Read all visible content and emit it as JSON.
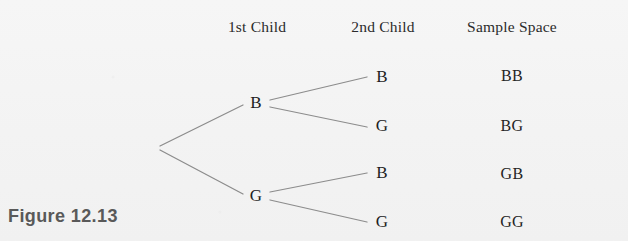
{
  "figure": {
    "caption": "Figure 12.13",
    "background_color": "#f4f4f4",
    "line_color": "#8c8c8c",
    "text_color": "#1f1f1f",
    "caption_color": "#595959"
  },
  "headers": [
    {
      "label": "1st Child",
      "x": 257,
      "y": 31
    },
    {
      "label": "2nd Child",
      "x": 383,
      "y": 31
    },
    {
      "label": "Sample Space",
      "x": 512,
      "y": 31
    }
  ],
  "tree": {
    "root": {
      "x": 158,
      "y": 148
    },
    "level1": [
      {
        "label": "B",
        "x": 256,
        "y": 103
      },
      {
        "label": "G",
        "x": 256,
        "y": 196
      }
    ],
    "level2": [
      {
        "label": "B",
        "x": 382,
        "y": 77
      },
      {
        "label": "G",
        "x": 382,
        "y": 126
      },
      {
        "label": "B",
        "x": 382,
        "y": 173
      },
      {
        "label": "G",
        "x": 382,
        "y": 222
      }
    ]
  },
  "sample_space": [
    {
      "label": "BB",
      "x": 512,
      "y": 76
    },
    {
      "label": "BG",
      "x": 512,
      "y": 126
    },
    {
      "label": "GB",
      "x": 512,
      "y": 174
    },
    {
      "label": "GG",
      "x": 512,
      "y": 222
    }
  ]
}
